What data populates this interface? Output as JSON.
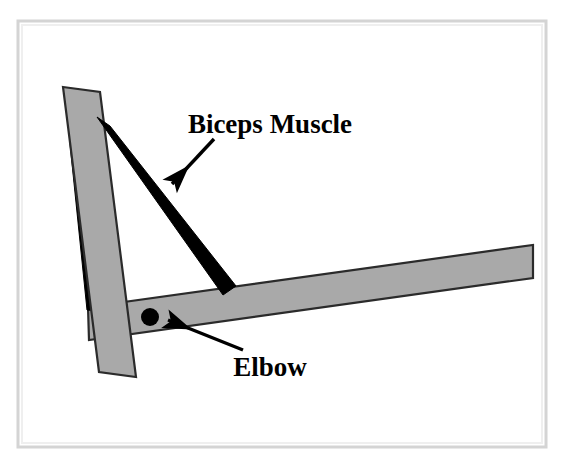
{
  "figure": {
    "title_caption": "",
    "background_color": "#ffffff",
    "frame_color": "#d6d6d6",
    "bone_fill_color": "#a9a9a9",
    "bone_stroke_color": "#2b2b2b",
    "muscle_color": "#000000",
    "joint_color": "#000000",
    "labels": [
      {
        "id": "biceps",
        "text": "Biceps Muscle",
        "x": 270,
        "y": 133,
        "font_size": 27,
        "anchor": "middle"
      },
      {
        "id": "elbow",
        "text": "Elbow",
        "x": 270,
        "y": 376,
        "font_size": 27,
        "anchor": "middle"
      }
    ],
    "annotations": [
      {
        "id": "biceps-arrow",
        "points_from": "Biceps Muscle",
        "points_to": "biceps muscle band",
        "start_x": 214,
        "start_y": 139,
        "end_x": 168,
        "end_y": 188
      },
      {
        "id": "elbow-arrow",
        "points_from": "Elbow",
        "points_to": "elbow joint",
        "start_x": 243,
        "start_y": 350,
        "end_x": 163,
        "end_y": 317
      }
    ],
    "parts": [
      {
        "id": "upper-arm-bone",
        "name": "upper arm bone (humerus)"
      },
      {
        "id": "forearm-bone",
        "name": "forearm bone (radius/ulna)"
      },
      {
        "id": "biceps-band-outer",
        "name": "biceps muscle outer band"
      },
      {
        "id": "biceps-band-inner",
        "name": "biceps muscle inner band"
      },
      {
        "id": "elbow-joint",
        "name": "elbow pivot joint"
      }
    ],
    "geometry": {
      "upper_arm_bone_polygon": "63,87 100,92 136,377 99,372",
      "forearm_bone_polygon": "88,307 533,245 533,278 89,340",
      "biceps_outer_polygon": "98,118 110,126 235,286 223,294",
      "biceps_inner_polygon": "70,144 82,146 99,310 87,309",
      "elbow_joint_cx": 150,
      "elbow_joint_cy": 317,
      "elbow_joint_r": 9
    }
  }
}
